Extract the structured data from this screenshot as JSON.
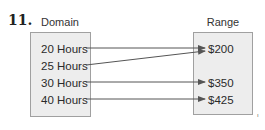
{
  "problem": {
    "number": "11."
  },
  "domain": {
    "label": "Domain",
    "items": [
      "20 Hours",
      "25 Hours",
      "30 Hours",
      "40 Hours"
    ]
  },
  "range": {
    "label": "Range",
    "items": [
      "$200",
      "$350",
      "$425"
    ]
  },
  "mappings": [
    {
      "from": "20 Hours",
      "to": "$200"
    },
    {
      "from": "25 Hours",
      "to": "$200"
    },
    {
      "from": "30 Hours",
      "to": "$350"
    },
    {
      "from": "40 Hours",
      "to": "$425"
    }
  ],
  "corner_mark": "ı",
  "colors": {
    "box_fill": "#ededed",
    "box_border": "#a0a0a0",
    "arrow": "#555555",
    "text": "#2a2a2a"
  }
}
